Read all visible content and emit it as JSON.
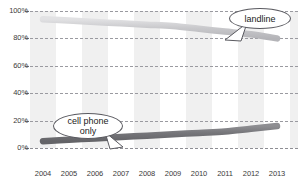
{
  "chart_data": {
    "type": "line",
    "title": "",
    "subtitle": "",
    "xlabel": "",
    "ylabel": "",
    "x": [
      2004,
      2005,
      2006,
      2007,
      2008,
      2009,
      2010,
      2011,
      2012,
      2013
    ],
    "xtick_labels": [
      "2004",
      "2005",
      "2006",
      "2007",
      "2008",
      "2009",
      "2010",
      "2011",
      "2012",
      "2013"
    ],
    "ytick_labels": [
      "0%",
      "20%",
      "40%",
      "60%",
      "80%",
      "100%"
    ],
    "ytick_values": [
      0,
      20,
      40,
      60,
      80,
      100
    ],
    "ylim": [
      0,
      100
    ],
    "xlim": [
      2004,
      2013
    ],
    "grid": true,
    "grid_style": "dashed-horizontal",
    "legend": "annotations",
    "background_bands": "alternating vertical gray bands",
    "series": [
      {
        "name": "landline",
        "color": "#c9c9cc",
        "values": [
          94,
          93,
          92,
          91,
          90,
          89,
          87,
          85,
          83,
          80
        ]
      },
      {
        "name": "cell phone only",
        "color": "#7a7a7e",
        "values": [
          5,
          6,
          7,
          8,
          9,
          10,
          11,
          12,
          14,
          16
        ]
      }
    ],
    "annotations": [
      {
        "id": "landline",
        "label": "landline",
        "style": "speech-bubble"
      },
      {
        "id": "cellphone",
        "label_line1": "cell phone",
        "label_line2": "only",
        "style": "speech-bubble"
      }
    ]
  },
  "axis": {
    "y_ticks": [
      {
        "label": "100%",
        "value": 100
      },
      {
        "label": "80%",
        "value": 80
      },
      {
        "label": "60%",
        "value": 60
      },
      {
        "label": "40%",
        "value": 40
      },
      {
        "label": "20%",
        "value": 20
      },
      {
        "label": "0%",
        "value": 0
      }
    ],
    "x_ticks": [
      {
        "label": "2004"
      },
      {
        "label": "2005"
      },
      {
        "label": "2006"
      },
      {
        "label": "2007"
      },
      {
        "label": "2008"
      },
      {
        "label": "2009"
      },
      {
        "label": "2010"
      },
      {
        "label": "2011"
      },
      {
        "label": "2012"
      },
      {
        "label": "2013"
      }
    ]
  },
  "colors": {
    "landline": "#c9c9cc",
    "cellphone": "#7a7a7e",
    "band": "#f0f0f0",
    "grid": "#9a9aa0",
    "text": "#3a3a3a"
  }
}
